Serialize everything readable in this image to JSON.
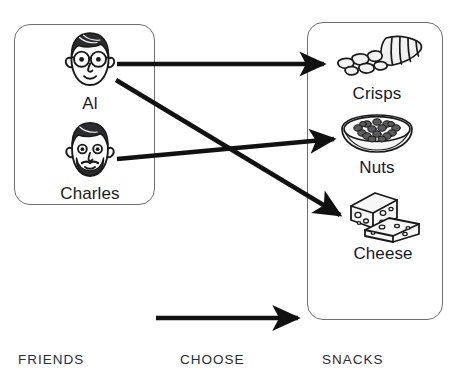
{
  "diagram": {
    "stroke_color": "#6e6e70",
    "arrow_color": "#111111",
    "text_color": "#1a1a1a"
  },
  "friends_group": {
    "name": "friends-box",
    "items": [
      {
        "id": "al",
        "label": "Al",
        "icon": "face-with-glasses-icon"
      },
      {
        "id": "charles",
        "label": "Charles",
        "icon": "face-with-beard-icon"
      }
    ]
  },
  "snacks_group": {
    "name": "snacks-box",
    "items": [
      {
        "id": "crisps",
        "label": "Crisps",
        "icon": "crisps-bag-icon"
      },
      {
        "id": "nuts",
        "label": "Nuts",
        "icon": "bowl-of-nuts-icon"
      },
      {
        "id": "cheese",
        "label": "Cheese",
        "icon": "cheese-wedges-icon"
      }
    ]
  },
  "arrows": [
    {
      "id": "al-to-crisps",
      "from": "al",
      "to": "crisps",
      "x1": 117,
      "y1": 64,
      "x2": 326,
      "y2": 64
    },
    {
      "id": "al-to-cheese",
      "from": "al",
      "to": "cheese",
      "x1": 116,
      "y1": 80,
      "x2": 342,
      "y2": 216
    },
    {
      "id": "charles-to-nuts",
      "from": "charles",
      "to": "nuts",
      "x1": 117,
      "y1": 159,
      "x2": 336,
      "y2": 139
    },
    {
      "id": "choose-arrow",
      "from": "friends",
      "to": "snacks",
      "x1": 156,
      "y1": 318,
      "x2": 300,
      "y2": 318
    }
  ],
  "captions": {
    "friends": "FRIENDS",
    "choose": "CHOOSE",
    "snacks": "SNACKS"
  }
}
